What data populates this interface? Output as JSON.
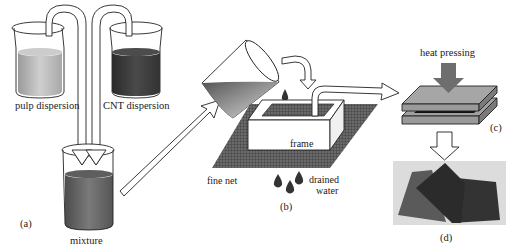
{
  "figure": {
    "panels": [
      {
        "id": "a",
        "label": "(a)"
      },
      {
        "id": "b",
        "label": "(b)"
      },
      {
        "id": "c",
        "label": "(c)"
      },
      {
        "id": "d",
        "label": "(d)"
      }
    ],
    "labels": {
      "pulp_dispersion": "pulp dispersion",
      "cnt_dispersion": "CNT dispersion",
      "mixture": "mixture",
      "frame": "frame",
      "fine_net": "fine net",
      "drained_line1": "drained",
      "drained_line2": "water",
      "heat_pressing": "heat pressing"
    },
    "colors": {
      "pulp_liquid": "#bdbdbd",
      "cnt_liquid": "#3e3e3e",
      "mixture_liquid": "#6a6a6a",
      "net": "#5a5a5a",
      "press_plate": "#9a9a9a",
      "photo_bg": "#dcdcdc",
      "sheet_dark": "#2e2e2e",
      "sheet_mid": "#4a4a4a"
    }
  }
}
